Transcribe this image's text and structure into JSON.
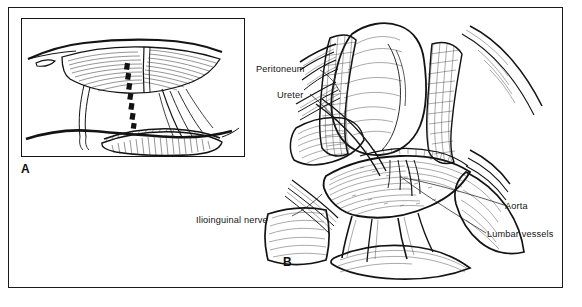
{
  "figure": {
    "type": "medical-illustration",
    "style": "pen-and-ink line drawing",
    "background_color": "#ffffff",
    "ink_color": "#131313",
    "panels": [
      {
        "letter": "A",
        "name": "inset-orientation-view",
        "description": "Lateral torso orientation view with dashed incision line over the flank"
      },
      {
        "letter": "B",
        "name": "surgical-exposure-view",
        "description": "Retroperitoneal surgical exposure with retracted peritoneum"
      }
    ]
  },
  "panel_a": {
    "letter": "A",
    "incision_marker": "dashed-incision-line"
  },
  "panel_b": {
    "letter": "B",
    "labels": [
      {
        "id": "peritoneum",
        "text": "Peritoneum"
      },
      {
        "id": "ureter",
        "text": "Ureter"
      },
      {
        "id": "ilioinguinal-nerve",
        "text": "Ilioinguinal nerve"
      },
      {
        "id": "aorta",
        "text": "Aorta"
      },
      {
        "id": "lumbar-vessels",
        "text": "Lumbar vessels"
      }
    ]
  }
}
